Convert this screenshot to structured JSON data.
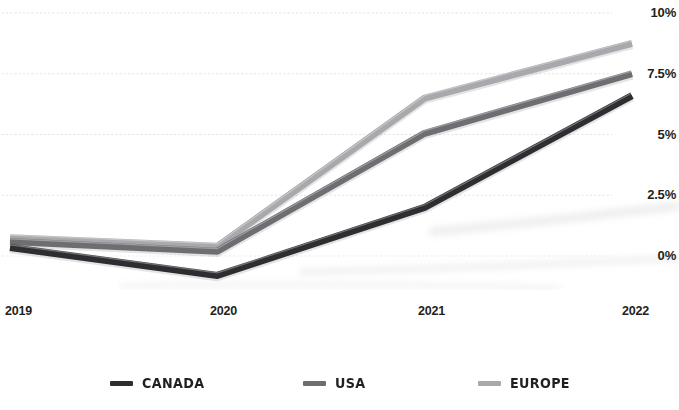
{
  "chart_data": {
    "type": "line",
    "title": "",
    "subtitle": "",
    "xlabel": "",
    "ylabel": "",
    "categories": [
      "2019",
      "2020",
      "2021",
      "2022"
    ],
    "x": [
      2019,
      2020,
      2021,
      2022
    ],
    "series": [
      {
        "name": "CANADA",
        "color": "#2e2e30",
        "values": [
          0.35,
          -0.8,
          2.0,
          6.6
        ]
      },
      {
        "name": "USA",
        "color": "#6e6e72",
        "values": [
          0.6,
          0.2,
          5.05,
          7.5
        ]
      },
      {
        "name": "EUROPE",
        "color": "#a9a9ad",
        "values": [
          0.75,
          0.4,
          6.5,
          8.75
        ]
      }
    ],
    "ylim": [
      -1.2,
      10.3
    ],
    "yticks": [
      0,
      2.5,
      5,
      7.5,
      10
    ],
    "ytick_labels": [
      "0%",
      "2.5%",
      "5%",
      "7.5%",
      "10%"
    ],
    "xtick_labels": [
      "2019",
      "2020",
      "2021",
      "2022"
    ],
    "grid": true,
    "grid_axis": "y",
    "legend_position": "bottom",
    "y_axis_side": "right"
  },
  "axes": {
    "y_ticks": [
      {
        "label": "10%",
        "value": 10
      },
      {
        "label": "7.5%",
        "value": 7.5
      },
      {
        "label": "5%",
        "value": 5
      },
      {
        "label": "2.5%",
        "value": 2.5
      },
      {
        "label": "0%",
        "value": 0
      }
    ],
    "x_ticks": [
      {
        "label": "2019"
      },
      {
        "label": "2020"
      },
      {
        "label": "2021"
      },
      {
        "label": "2022"
      }
    ]
  },
  "legend": {
    "items": [
      {
        "label": "CANADA",
        "color": "#2e2e30"
      },
      {
        "label": "USA",
        "color": "#6e6e72"
      },
      {
        "label": "EUROPE",
        "color": "#a9a9ad"
      }
    ]
  },
  "style": {
    "background": "#ffffff",
    "text_color": "#231f20",
    "grid_color": "#d9d9dd"
  }
}
